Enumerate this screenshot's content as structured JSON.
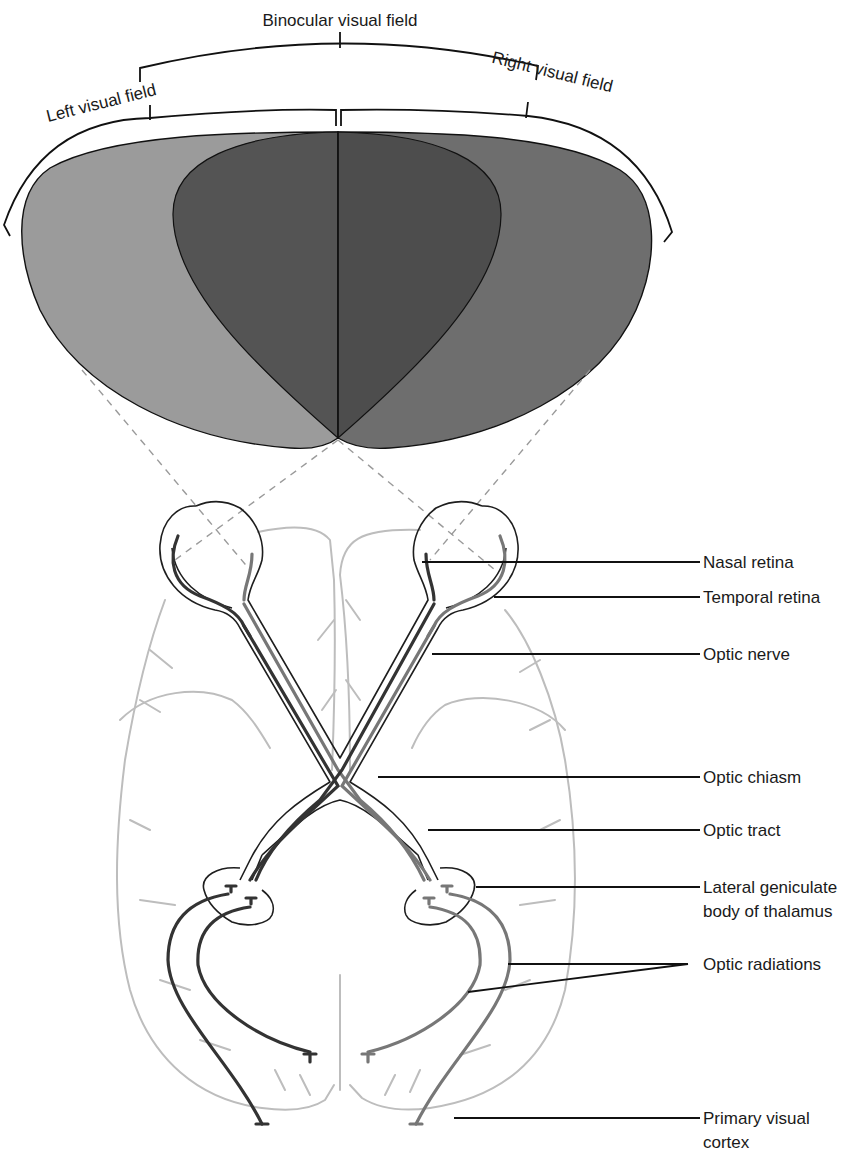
{
  "figure": {
    "field_labels": {
      "binocular": "Binocular visual field",
      "left": "Left visual field",
      "right": "Right visual field"
    },
    "callouts": [
      {
        "id": "nasal-retina",
        "lines": [
          "Nasal retina"
        ]
      },
      {
        "id": "temporal-retina",
        "lines": [
          "Temporal retina"
        ]
      },
      {
        "id": "optic-nerve",
        "lines": [
          "Optic nerve"
        ]
      },
      {
        "id": "optic-chiasm",
        "lines": [
          "Optic chiasm"
        ]
      },
      {
        "id": "optic-tract",
        "lines": [
          "Optic tract"
        ]
      },
      {
        "id": "lateral-geniculate",
        "lines": [
          "Lateral geniculate",
          "body of thalamus"
        ]
      },
      {
        "id": "optic-radiations",
        "lines": [
          "Optic radiations"
        ]
      },
      {
        "id": "primary-visual-cortex",
        "lines": [
          "Primary visual",
          "cortex"
        ]
      }
    ],
    "colors": {
      "left_field": "#9b9b9b",
      "right_field": "#6e6e6e",
      "binocular_left": "#545454",
      "binocular_right": "#4d4d4d",
      "brain_outline": "#bdbdbd",
      "fiber_dark": "#333333",
      "fiber_light": "#777777"
    }
  }
}
